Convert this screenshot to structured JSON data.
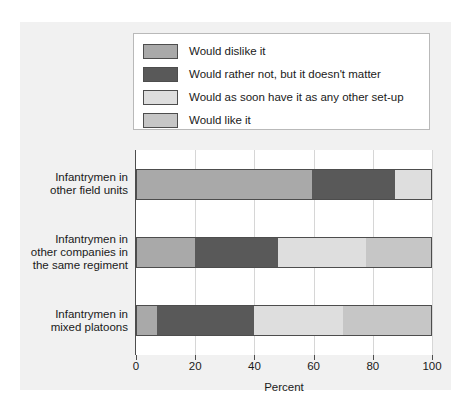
{
  "chart_data": {
    "type": "bar",
    "orientation": "horizontal",
    "stacked": true,
    "title": "",
    "xlabel": "Percent",
    "ylabel": "",
    "xlim": [
      0,
      100
    ],
    "xticks": [
      0,
      20,
      40,
      60,
      80,
      100
    ],
    "grid": true,
    "legend_position": "top",
    "categories": [
      "Infantrymen in\nother field units",
      "Infantrymen in\nother companies in\nthe same regiment",
      "Infantrymen in\nmixed platoons"
    ],
    "category_lines": [
      [
        "Infantrymen in",
        "other field units"
      ],
      [
        "Infantrymen in",
        "other companies in",
        "the same regiment"
      ],
      [
        "Infantrymen in",
        "mixed platoons"
      ]
    ],
    "series": [
      {
        "name": "Would dislike it",
        "color": "#a9a9a9",
        "values": [
          60,
          20,
          7
        ]
      },
      {
        "name": "Would rather not, but it doesn't matter",
        "color": "#595959",
        "values": [
          28,
          28,
          33
        ]
      },
      {
        "name": "Would as soon have it as any other set-up",
        "color": "#dedede",
        "values": [
          12,
          30,
          30
        ]
      },
      {
        "name": "Would like it",
        "color": "#c6c6c6",
        "values": [
          0,
          22,
          30
        ]
      }
    ]
  },
  "colors": {
    "panel_background": "#f1f1f1",
    "plot_background": "#ffffff",
    "gridline": "#d6d6d6",
    "axis": "#4d4d4d",
    "text": "#1a1a1a"
  }
}
